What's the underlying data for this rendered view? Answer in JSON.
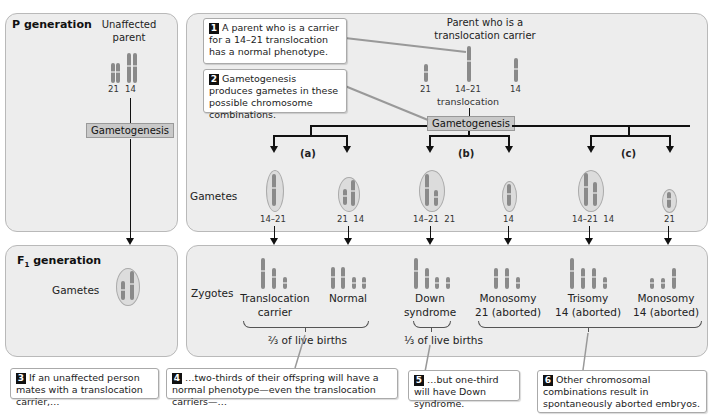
{
  "p_generation": {
    "title": "P generation",
    "parent_label_line1": "Unaffected",
    "parent_label_line2": "parent",
    "chromosome_labels": [
      "21",
      "14"
    ],
    "process": "Gametogenesis"
  },
  "carrier_parent": {
    "label_line1": "Parent who is a",
    "label_line2": "translocation carrier",
    "chromosome_labels": [
      "21",
      "14–21",
      "14"
    ],
    "translocation_word": "translocation",
    "process": "Gametogenesis"
  },
  "gametes": {
    "row_label": "Gametes",
    "groups": [
      {
        "id": "(a)",
        "items": [
          {
            "label": "14–21"
          },
          {
            "label": "21  14"
          }
        ]
      },
      {
        "id": "(b)",
        "items": [
          {
            "label": "14–21  21"
          },
          {
            "label": "14"
          }
        ]
      },
      {
        "id": "(c)",
        "items": [
          {
            "label": "14–21  14"
          },
          {
            "label": "21"
          }
        ]
      }
    ]
  },
  "f1_generation": {
    "title_prefix": "F",
    "title_sub": "1",
    "title_suffix": " generation",
    "gametes_label": "Gametes"
  },
  "zygotes": {
    "row_label": "Zygotes",
    "items": [
      {
        "line1": "Translocation",
        "line2": "carrier"
      },
      {
        "line1": "Normal",
        "line2": ""
      },
      {
        "line1": "Down",
        "line2": "syndrome"
      },
      {
        "line1": "Monosomy",
        "line2": "21 (aborted)"
      },
      {
        "line1": "Trisomy",
        "line2": "14 (aborted)"
      },
      {
        "line1": "Monosomy",
        "line2": "14 (aborted)"
      }
    ],
    "fraction_two_thirds": "⅔ of live births",
    "fraction_one_third": "⅓ of live births"
  },
  "callouts": [
    {
      "num": "1",
      "text": "A parent who is a carrier for a 14–21 translocation has a normal phenotype."
    },
    {
      "num": "2",
      "text": "Gametogenesis produces gametes in these possible chromosome combinations."
    },
    {
      "num": "3",
      "text": "If an unaffected person mates with a translocation carrier,…"
    },
    {
      "num": "4",
      "text": "…two-thirds of their offspring will have a normal phenotype—even the translocation carriers—…"
    },
    {
      "num": "5",
      "text": "…but one-third will have Down syndrome."
    },
    {
      "num": "6",
      "text": "Other chromosomal combinations result in spontaneously aborted embryos."
    }
  ],
  "colors": {
    "panel": "#ededed",
    "chromosome": "#8a8a8a",
    "process_box": "#c9c9c9",
    "number_badge": "#111111"
  }
}
